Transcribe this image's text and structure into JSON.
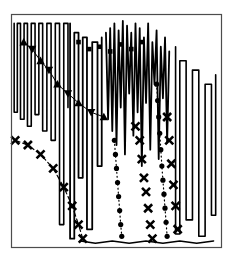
{
  "figure": {
    "background_color": "#ffffff",
    "ink_color": "#000000",
    "frame_color": "#4d4d4d",
    "title": "",
    "subtitle": "",
    "caption": ""
  },
  "frame": {
    "x": 11,
    "y": 14,
    "width": 211,
    "height": 234,
    "border_width": 1.2,
    "fill": "#ffffff"
  },
  "chart_data": {
    "type": "line",
    "title": "",
    "subtitle": "",
    "xlabel": "",
    "ylabel": "",
    "xlim": [
      0,
      100
    ],
    "ylim": [
      0,
      100
    ],
    "xticks": [],
    "yticks": [],
    "xticklabels": [],
    "yticklabels": [],
    "grid": false,
    "legend": false,
    "legend_position": "none",
    "annotations": [],
    "series": [
      {
        "name": "oscillating-trace-left",
        "style": "solid",
        "linewidth": 1.6,
        "marker": "none",
        "color": "#000000",
        "comment": "Square-wave style narrow U spikes across the left quarter",
        "x": [
          1.5,
          1.5,
          3.0,
          3.0,
          4.5,
          4.5,
          6.2,
          6.2,
          7.8,
          7.8,
          9.6,
          9.6,
          11.4,
          11.4,
          13.2,
          13.2,
          15.0,
          15.0,
          17.0,
          17.0,
          19.0,
          19.0,
          21.0,
          21.0,
          23.0,
          23.0,
          25.0,
          25.0,
          27.0,
          27.0
        ],
        "y": [
          96,
          58,
          58,
          96,
          96,
          55,
          55,
          96,
          96,
          52,
          52,
          96,
          96,
          57,
          57,
          96,
          96,
          50,
          50,
          96,
          96,
          46,
          46,
          96,
          96,
          10,
          10,
          96,
          96,
          60
        ]
      },
      {
        "name": "deep-spike-trace",
        "style": "solid",
        "linewidth": 1.8,
        "marker": "none",
        "color": "#000000",
        "comment": "Very deep narrow vertical excursions reaching the baseline",
        "x": [
          28,
          28,
          30,
          30,
          32,
          32,
          34,
          34,
          36,
          36,
          38.5,
          38.5,
          41,
          41,
          43,
          43
        ],
        "y": [
          96,
          4,
          4,
          92,
          92,
          30,
          30,
          90,
          90,
          8,
          8,
          88,
          88,
          35,
          35,
          90
        ]
      },
      {
        "name": "oscillating-trace-center",
        "style": "solid",
        "linewidth": 1.8,
        "marker": "none",
        "color": "#000000",
        "comment": "Dense scribble-like oscillation across the center top",
        "x": [
          45,
          46,
          47,
          48,
          49,
          50,
          51,
          52,
          53,
          54,
          55,
          56,
          57,
          58,
          59,
          60,
          61,
          62,
          63,
          64,
          65,
          66,
          67,
          68,
          69,
          70,
          71,
          72,
          73,
          74,
          75
        ],
        "y": [
          92,
          55,
          94,
          50,
          96,
          44,
          93,
          60,
          97,
          40,
          95,
          66,
          92,
          48,
          96,
          58,
          94,
          35,
          90,
          62,
          96,
          42,
          88,
          70,
          93,
          38,
          86,
          64,
          90,
          45,
          84
        ]
      },
      {
        "name": "oscillating-trace-right",
        "style": "solid",
        "linewidth": 1.6,
        "marker": "none",
        "color": "#000000",
        "comment": "Right hand tall narrow spikes descending to baseline",
        "x": [
          78,
          78,
          80,
          80,
          83,
          83,
          86,
          86,
          89,
          89,
          92,
          92,
          95,
          95,
          97,
          97
        ],
        "y": [
          86,
          6,
          6,
          80,
          80,
          12,
          12,
          76,
          76,
          5,
          5,
          70,
          70,
          14,
          14,
          74
        ]
      },
      {
        "name": "triangle-series",
        "style": "solid",
        "linewidth": 1.0,
        "marker": "triangle",
        "color": "#000000",
        "comment": "Filled up/down triangles descending from upper left",
        "x": [
          6,
          10,
          14,
          18,
          22,
          27,
          32,
          38,
          44
        ],
        "y": [
          88,
          85,
          80,
          76,
          70,
          66,
          62,
          58,
          56
        ]
      },
      {
        "name": "square-series",
        "style": "none",
        "linewidth": 0,
        "marker": "square",
        "color": "#000000",
        "comment": "Small filled squares forming a shallow arc near the top",
        "x": [
          32,
          37,
          42,
          47,
          52,
          57,
          62
        ],
        "y": [
          88,
          85,
          86,
          84,
          87,
          85,
          88
        ]
      },
      {
        "name": "x-series-left",
        "style": "dashed",
        "linewidth": 1.2,
        "marker": "x",
        "color": "#000000",
        "comment": "Bold X markers on a dashed line descending steeply at left",
        "x": [
          2,
          8,
          14,
          20,
          25,
          29,
          32,
          34
        ],
        "y": [
          46,
          44,
          40,
          34,
          26,
          18,
          10,
          4
        ]
      },
      {
        "name": "x-series-right",
        "style": "none",
        "linewidth": 0,
        "marker": "x",
        "color": "#000000",
        "comment": "Bold X markers descending in a column at center-right",
        "x": [
          59,
          61,
          62,
          63,
          64,
          65,
          66,
          67
        ],
        "y": [
          52,
          46,
          38,
          30,
          24,
          17,
          10,
          4
        ]
      },
      {
        "name": "x-series-far-right",
        "style": "none",
        "linewidth": 0,
        "marker": "x",
        "color": "#000000",
        "comment": "Bold X markers in a steep column toward the right edge",
        "x": [
          74,
          75,
          76,
          77,
          78,
          79
        ],
        "y": [
          56,
          46,
          36,
          27,
          18,
          8
        ]
      },
      {
        "name": "dot-series",
        "style": "dotted",
        "linewidth": 1.2,
        "marker": "circle",
        "color": "#000000",
        "comment": "Round dot markers forming a near-vertical dotted descent",
        "x": [
          69,
          69.5,
          70,
          70.5,
          71,
          71.5,
          72,
          72.5,
          73,
          73.5,
          74
        ],
        "y": [
          70,
          63,
          56,
          49,
          42,
          35,
          29,
          23,
          17,
          11,
          5
        ]
      },
      {
        "name": "dot-series-left",
        "style": "dotted",
        "linewidth": 1.2,
        "marker": "circle",
        "color": "#000000",
        "comment": "Second dotted descent just left of center",
        "x": [
          49,
          49.5,
          50,
          50.5,
          51,
          51.5,
          52,
          52.5
        ],
        "y": [
          46,
          40,
          34,
          28,
          22,
          16,
          10,
          5
        ]
      },
      {
        "name": "baseline-trace",
        "style": "solid",
        "linewidth": 1.6,
        "marker": "none",
        "color": "#000000",
        "comment": "Trace that runs along the bottom of the frame",
        "x": [
          33,
          40,
          48,
          56,
          64,
          72,
          80,
          88,
          96
        ],
        "y": [
          3,
          2,
          3,
          2,
          3,
          2,
          3,
          2,
          3
        ]
      }
    ]
  }
}
